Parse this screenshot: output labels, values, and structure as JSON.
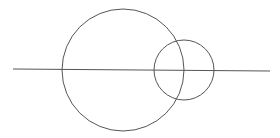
{
  "diagram": {
    "background": "#ffffff",
    "stroke_color": "#555555",
    "line": {
      "x1": 13,
      "y1": 69,
      "x2": 270,
      "y2": 71
    },
    "large_circle": {
      "cx": 123,
      "cy": 70,
      "r": 61
    },
    "small_circle": {
      "cx": 184,
      "cy": 70,
      "r": 30
    }
  }
}
